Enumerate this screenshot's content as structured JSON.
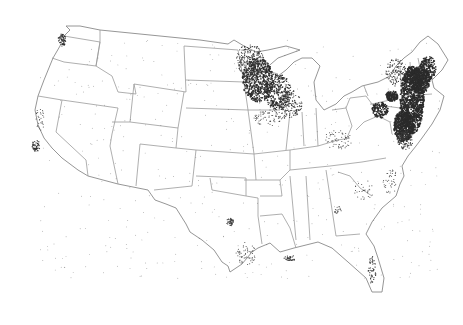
{
  "map": {
    "subject": "Contiguous United States dot-density map",
    "colors": {
      "background": "#ffffff",
      "state_border": "#9a9a9a",
      "dots": "#2b2b2b"
    },
    "dense_regions": [
      "Minnesota / Wisconsin / Iowa (upper Midwest)",
      "New England / New York / Pennsylvania / New Jersey (Northeast)"
    ],
    "sparse_regions": [
      "Puget Sound, Washington",
      "San Francisco Bay, California",
      "Dallas-Fort Worth, Texas",
      "Gulf Coast",
      "Florida coasts",
      "Atlanta, Georgia"
    ]
  }
}
